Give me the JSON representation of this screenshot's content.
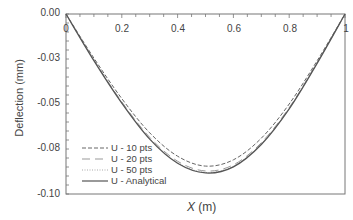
{
  "chart_data": {
    "type": "line",
    "title": "",
    "xlabel_var": "X",
    "xlabel_unit": "(m)",
    "ylabel": "Deflection (mm)",
    "xlim": [
      0,
      1
    ],
    "ylim": [
      -0.1,
      0.0
    ],
    "x_ticks": [
      "0",
      "0.2",
      "0.4",
      "0.6",
      "0.8",
      "1"
    ],
    "y_ticks": [
      "0.00",
      "-0.03",
      "-0.05",
      "-0.08",
      "-0.10"
    ],
    "grid": false,
    "legend_position": "lower left",
    "x": [
      0,
      0.1,
      0.2,
      0.3,
      0.4,
      0.5,
      0.6,
      0.7,
      0.8,
      0.9,
      1.0
    ],
    "series": [
      {
        "name": "U - 10 pts",
        "style": "short-dash",
        "values": [
          0,
          -0.0245,
          -0.047,
          -0.066,
          -0.079,
          -0.0845,
          -0.081,
          -0.069,
          -0.05,
          -0.026,
          0
        ]
      },
      {
        "name": "U - 20 pts",
        "style": "long-dash",
        "values": [
          0,
          -0.0255,
          -0.0488,
          -0.0685,
          -0.0818,
          -0.0872,
          -0.0838,
          -0.0715,
          -0.052,
          -0.027,
          0
        ]
      },
      {
        "name": "U - 50 pts",
        "style": "dotted",
        "values": [
          0,
          -0.0258,
          -0.0493,
          -0.0692,
          -0.0826,
          -0.088,
          -0.0846,
          -0.0722,
          -0.0525,
          -0.0273,
          0
        ]
      },
      {
        "name": "U - Analytical",
        "style": "solid",
        "values": [
          0,
          -0.0259,
          -0.0495,
          -0.0695,
          -0.0829,
          -0.0883,
          -0.0849,
          -0.0725,
          -0.0527,
          -0.0274,
          0
        ]
      }
    ]
  },
  "legend": [
    {
      "label": "U - 10 pts"
    },
    {
      "label": "U - 20 pts"
    },
    {
      "label": "U - 50 pts"
    },
    {
      "label": "U - Analytical"
    }
  ]
}
